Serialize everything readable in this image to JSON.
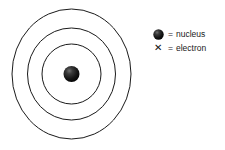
{
  "diagram": {
    "title": "",
    "background_color": "#ffffff",
    "shell_stroke_color": "#1a1a1a",
    "nucleus_color": "#111111",
    "atom": {
      "center_x": 71.5,
      "center_y": 74,
      "nucleus_radius": 8,
      "shells": [
        {
          "name": "shell-1",
          "rx": 29.5,
          "ry": 30
        },
        {
          "name": "shell-2",
          "rx": 44.0,
          "ry": 46
        },
        {
          "name": "shell-3",
          "rx": 59.5,
          "ry": 65
        }
      ],
      "electrons": []
    }
  },
  "legend": {
    "items": [
      {
        "marker": "nucleus-dot-icon",
        "equals": "=",
        "label": "nucleus"
      },
      {
        "marker": "electron-x-icon",
        "equals": "=",
        "label": "electron",
        "glyph": "✕"
      }
    ]
  }
}
